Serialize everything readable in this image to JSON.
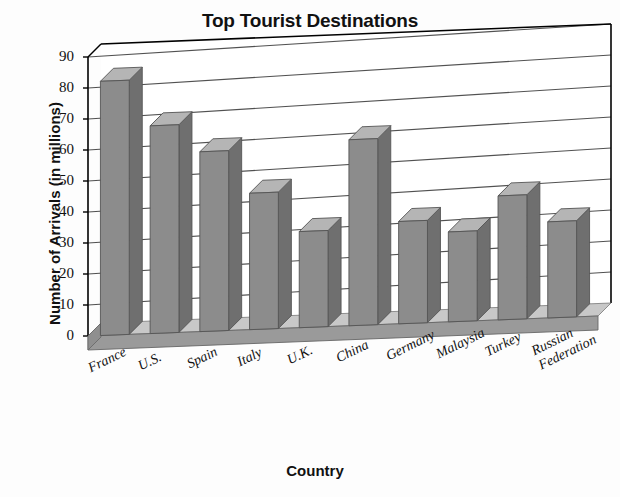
{
  "chart_data": {
    "type": "bar",
    "title": "Top Tourist Destinations",
    "xlabel": "Country",
    "ylabel": "Number of Arrivals (in millions)",
    "categories": [
      "France",
      "U.S.",
      "Spain",
      "Italy",
      "U.K.",
      "China",
      "Germany",
      "Malaysia",
      "Turkey",
      "Russian\nFederation"
    ],
    "values": [
      82,
      67,
      58,
      44,
      31,
      60,
      33,
      29,
      40,
      31
    ],
    "ylim": [
      0,
      90
    ],
    "ytick_labels": [
      "0",
      "10",
      "20",
      "30",
      "40",
      "50",
      "60",
      "70",
      "80",
      "90"
    ],
    "ytick_values": [
      0,
      10,
      20,
      30,
      40,
      50,
      60,
      70,
      80,
      90
    ],
    "grid": true,
    "legend": false,
    "style": "3d-bar",
    "colors": {
      "bar_face": "#8c8c8c",
      "bar_top": "#b5b5b5",
      "bar_side": "#6f6f6f",
      "floor_top": "#c8c8c8",
      "floor_front": "#9a9a9a",
      "axis_line": "#000000",
      "grid_line": "#333333",
      "background": "#fdfdfd",
      "text": "#111111"
    }
  }
}
